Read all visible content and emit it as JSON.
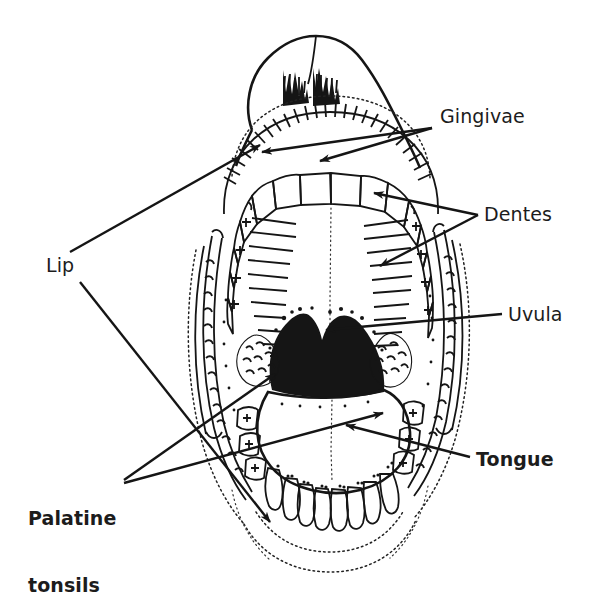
{
  "figure": {
    "background_color": "#ffffff",
    "ink_color": "#151515",
    "width": 592,
    "height": 604
  },
  "labels": [
    {
      "id": "gingivae",
      "text": "Gingivae",
      "weight": "regular",
      "x": 440,
      "y": 113,
      "leaders": [
        {
          "from": [
            432,
            128
          ],
          "to": [
            258,
            150
          ],
          "arrow": true
        },
        {
          "from": [
            432,
            128
          ],
          "to": [
            316,
            160
          ],
          "arrow": true
        }
      ]
    },
    {
      "id": "dentes",
      "text": "Dentes",
      "weight": "regular",
      "x": 484,
      "y": 203,
      "leaders": [
        {
          "from": [
            478,
            215
          ],
          "to": [
            372,
            192
          ],
          "arrow": true
        },
        {
          "from": [
            478,
            215
          ],
          "to": [
            378,
            265
          ],
          "arrow": true
        }
      ]
    },
    {
      "id": "uvula",
      "text": "Uvula",
      "weight": "regular",
      "x": 508,
      "y": 303,
      "leaders": [
        {
          "from": [
            502,
            314
          ],
          "to": [
            322,
            331
          ],
          "arrow": true
        }
      ]
    },
    {
      "id": "tongue",
      "text": "Tongue",
      "weight": "bold",
      "x": 476,
      "y": 448,
      "leaders": [
        {
          "from": [
            470,
            457
          ],
          "to": [
            342,
            424
          ],
          "arrow": true
        }
      ]
    },
    {
      "id": "lip",
      "text": "Lip",
      "weight": "regular",
      "x": 46,
      "y": 254,
      "leaders": [
        {
          "from": [
            68,
            252
          ],
          "to": [
            263,
            143
          ],
          "arrow": true
        },
        {
          "from": [
            78,
            282
          ],
          "to": [
            272,
            525
          ],
          "arrow": true
        }
      ]
    },
    {
      "id": "palatine-tonsils",
      "text": "Palatine\ntonsils",
      "line1": "Palatine",
      "line2": "tonsils",
      "weight": "bold",
      "x": 28,
      "y": 470,
      "leaders": [
        {
          "from": [
            124,
            480
          ],
          "to": [
            272,
            372
          ],
          "arrow": true
        },
        {
          "from": [
            124,
            482
          ],
          "to": [
            386,
            412
          ],
          "arrow": true
        }
      ]
    }
  ],
  "structures": [
    {
      "name": "upper-lip-philtrum",
      "type": "outline"
    },
    {
      "name": "nostril-shading",
      "type": "fill"
    },
    {
      "name": "upper-gingiva-hatching",
      "type": "hatch"
    },
    {
      "name": "hard-palate",
      "type": "region"
    },
    {
      "name": "upper-dental-arch",
      "type": "teeth",
      "count": 16
    },
    {
      "name": "lower-dental-arch",
      "type": "teeth",
      "count": 12
    },
    {
      "name": "oropharynx-uvula",
      "type": "fill"
    },
    {
      "name": "palatine-tonsil-left",
      "type": "region"
    },
    {
      "name": "palatine-tonsil-right",
      "type": "region"
    },
    {
      "name": "tongue-dorsum",
      "type": "region"
    },
    {
      "name": "median-sulcus",
      "type": "dotted"
    },
    {
      "name": "buccal-fold-left",
      "type": "region"
    },
    {
      "name": "buccal-fold-right",
      "type": "region"
    },
    {
      "name": "lower-lip-chin",
      "type": "dotted-outline"
    }
  ]
}
